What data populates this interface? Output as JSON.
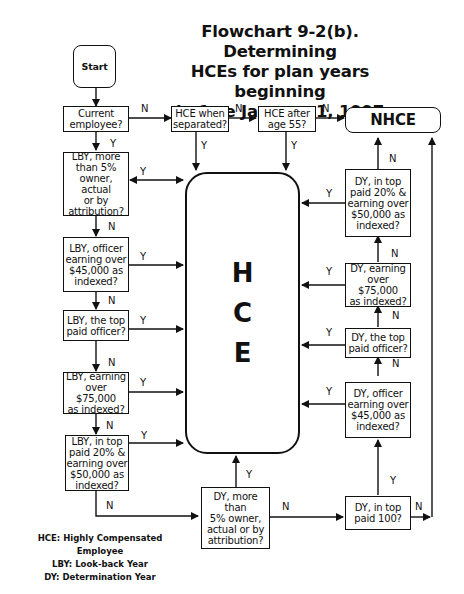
{
  "title": "Flowchart 9-2(b). Determining\nHCEs for plan years beginning\nbefore January 1, 1997",
  "nodes": {
    "start": "Start",
    "current_employee": "Current\nemployee?",
    "hce_when_separated": "HCE when\nseparated?",
    "hce_after_55": "HCE after\nage 55?",
    "nhce": "NHCE",
    "lby_5pct_owner": "LBY, more\nthan 5%\nowner, actual\nor by\nattribution?",
    "lby_officer_45000": "LBY, officer\nearning over\n$45,000 as\nindexed?",
    "lby_top_officer": "LBY, the top\npaid officer?",
    "lby_75000": "LBY, earning\nover $75,000\nas indexed?",
    "lby_top20": "LBY, in top\npaid 20% &\nearning over\n$50,000 as\nindexed?",
    "hce": [
      "H",
      "C",
      "E"
    ],
    "dy_top20": "DY, in top\npaid 20% &\nearning over\n$50,000 as\nindexed?",
    "dy_75000": "DY, earning\nover $75,000\nas indexed?",
    "dy_top_officer": "DY, the top\npaid officer?",
    "dy_officer_45000": "DY, officer\nearning over\n$45,000 as\nindexed?",
    "dy_5pct_owner": "DY, more than\n5% owner,\nactual or by\nattribution?",
    "dy_top100": "DY, in top\npaid 100?"
  },
  "edge_labels": {
    "yes": "Y",
    "no": "N"
  },
  "legend": [
    "HCE: Highly Compensated Employee",
    "LBY: Look-back Year",
    "DY: Determination Year"
  ]
}
